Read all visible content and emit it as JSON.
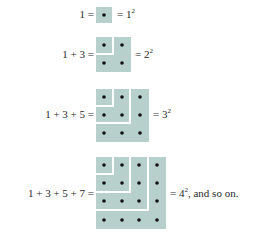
{
  "colors": {
    "fill": "#b8d0cb",
    "gap": "#ffffff",
    "dot": "#111111"
  },
  "rows": [
    {
      "n": 1,
      "lhs": "1 =",
      "rhs_base": "= 1",
      "rhs_exp": "2",
      "rhs_tail": ""
    },
    {
      "n": 2,
      "lhs": "1 + 3 =",
      "rhs_base": "= 2",
      "rhs_exp": "2",
      "rhs_tail": ""
    },
    {
      "n": 3,
      "lhs": "1 + 3 + 5 =",
      "rhs_base": "= 3",
      "rhs_exp": "2",
      "rhs_tail": ""
    },
    {
      "n": 4,
      "lhs": "1 + 3 + 5 + 7 =",
      "rhs_base": "= 4",
      "rhs_exp": "2",
      "rhs_tail": ", and so on."
    }
  ]
}
